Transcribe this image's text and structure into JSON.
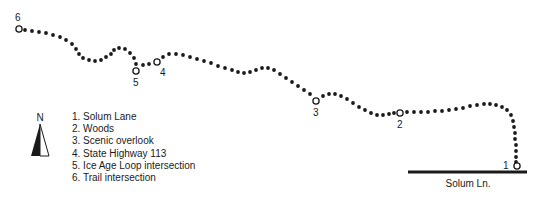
{
  "figure": {
    "type": "trail-map",
    "width": 537,
    "height": 203,
    "background": "#ffffff",
    "ink_color": "#1a1a1a"
  },
  "legend": {
    "items": [
      {
        "num": "1.",
        "label": "Solum Lane",
        "text": "1. Solum Lane"
      },
      {
        "num": "2.",
        "label": "Woods",
        "text": "2. Woods"
      },
      {
        "num": "3.",
        "label": "Scenic overlook",
        "text": "3. Scenic overlook"
      },
      {
        "num": "4.",
        "label": "State Highway 113",
        "text": "4. State Highway 113"
      },
      {
        "num": "5.",
        "label": "Ice Age Loop intersection",
        "text": "5. Ice Age Loop intersection"
      },
      {
        "num": "6.",
        "label": "Trail intersection",
        "text": "6. Trail intersection"
      }
    ]
  },
  "north_arrow": {
    "label": "N"
  },
  "road": {
    "name": "Solum Ln.",
    "x1": 408,
    "x2": 527,
    "y": 172,
    "thickness": 3,
    "color": "#1a1a1a"
  },
  "markers": [
    {
      "id": "1",
      "label": "1",
      "cx": 517,
      "cy": 166,
      "label_x": 503,
      "label_y": 161
    },
    {
      "id": "2",
      "label": "2",
      "cx": 400,
      "cy": 113,
      "label_x": 397,
      "label_y": 120
    },
    {
      "id": "3",
      "label": "3",
      "cx": 316,
      "cy": 101,
      "label_x": 313,
      "label_y": 108
    },
    {
      "id": "4",
      "label": "4",
      "cx": 157,
      "cy": 62,
      "label_x": 160,
      "label_y": 68
    },
    {
      "id": "5",
      "label": "5",
      "cx": 136,
      "cy": 71,
      "label_x": 133,
      "label_y": 78
    },
    {
      "id": "6",
      "label": "6",
      "cx": 19,
      "cy": 29,
      "label_x": 15,
      "label_y": 13
    }
  ],
  "marker_style": {
    "radius": 3.1,
    "stroke": "#1a1a1a",
    "stroke_width": 1.3,
    "fill": "#ffffff"
  },
  "trail": {
    "style": "dotted",
    "dot_radius": 1.9,
    "dot_color": "#1a1a1a",
    "dots": [
      [
        25,
        30
      ],
      [
        32,
        31
      ],
      [
        39,
        32
      ],
      [
        46,
        33
      ],
      [
        53,
        35
      ],
      [
        60,
        37
      ],
      [
        66,
        40
      ],
      [
        72,
        44
      ],
      [
        76,
        49
      ],
      [
        79,
        54
      ],
      [
        83,
        58
      ],
      [
        89,
        60
      ],
      [
        95,
        61
      ],
      [
        101,
        60
      ],
      [
        106,
        57
      ],
      [
        111,
        54
      ],
      [
        114,
        50
      ],
      [
        119,
        48
      ],
      [
        125,
        49
      ],
      [
        130,
        53
      ],
      [
        134,
        58
      ],
      [
        136,
        64
      ],
      [
        143,
        65
      ],
      [
        149,
        64
      ],
      [
        163,
        57
      ],
      [
        169,
        54
      ],
      [
        176,
        54
      ],
      [
        183,
        55
      ],
      [
        190,
        57
      ],
      [
        197,
        59
      ],
      [
        204,
        61
      ],
      [
        211,
        63
      ],
      [
        218,
        66
      ],
      [
        225,
        68
      ],
      [
        232,
        70
      ],
      [
        238,
        72
      ],
      [
        244,
        73
      ],
      [
        250,
        72
      ],
      [
        256,
        70
      ],
      [
        262,
        68
      ],
      [
        268,
        68
      ],
      [
        274,
        70
      ],
      [
        280,
        74
      ],
      [
        286,
        78
      ],
      [
        292,
        82
      ],
      [
        298,
        86
      ],
      [
        304,
        90
      ],
      [
        310,
        94
      ],
      [
        323,
        96
      ],
      [
        329,
        94
      ],
      [
        335,
        94
      ],
      [
        341,
        96
      ],
      [
        347,
        99
      ],
      [
        353,
        103
      ],
      [
        359,
        107
      ],
      [
        365,
        110
      ],
      [
        371,
        113
      ],
      [
        377,
        115
      ],
      [
        383,
        115
      ],
      [
        389,
        114
      ],
      [
        394,
        113
      ],
      [
        407,
        112
      ],
      [
        414,
        112
      ],
      [
        421,
        112
      ],
      [
        428,
        112
      ],
      [
        435,
        111
      ],
      [
        442,
        111
      ],
      [
        449,
        110
      ],
      [
        456,
        109
      ],
      [
        463,
        108
      ],
      [
        470,
        106
      ],
      [
        477,
        105
      ],
      [
        484,
        104
      ],
      [
        490,
        104
      ],
      [
        496,
        105
      ],
      [
        502,
        107
      ],
      [
        507,
        110
      ],
      [
        511,
        115
      ],
      [
        513,
        121
      ],
      [
        514,
        127
      ],
      [
        515,
        133
      ],
      [
        515,
        139
      ],
      [
        516,
        145
      ],
      [
        516,
        151
      ],
      [
        516,
        157
      ],
      [
        516,
        162
      ]
    ]
  }
}
